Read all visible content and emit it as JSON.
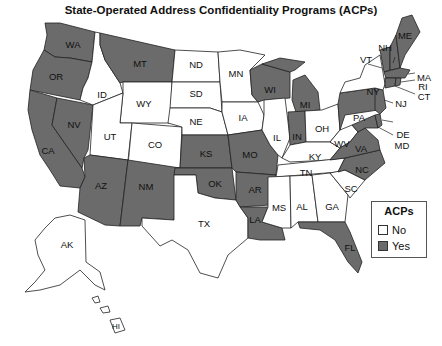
{
  "title": "State-Operated Address Confidentiality Programs (ACPs)",
  "colors": {
    "yes": "#6b6b6b",
    "no": "#ffffff",
    "border": "#222222"
  },
  "legend": {
    "title": "ACPs",
    "items": [
      {
        "label": "No",
        "color": "#ffffff"
      },
      {
        "label": "Yes",
        "color": "#6b6b6b"
      }
    ]
  },
  "states": {
    "WA": "Yes",
    "OR": "Yes",
    "CA": "Yes",
    "NV": "Yes",
    "ID": "No",
    "MT": "Yes",
    "WY": "No",
    "UT": "No",
    "CO": "No",
    "AZ": "Yes",
    "NM": "Yes",
    "ND": "No",
    "SD": "No",
    "NE": "No",
    "KS": "Yes",
    "OK": "Yes",
    "TX": "No",
    "MN": "No",
    "IA": "No",
    "MO": "Yes",
    "AR": "Yes",
    "LA": "Yes",
    "WI": "Yes",
    "IL": "No",
    "MI": "Yes",
    "IN": "Yes",
    "OH": "No",
    "KY": "No",
    "TN": "No",
    "MS": "No",
    "AL": "No",
    "GA": "No",
    "FL": "Yes",
    "SC": "No",
    "NC": "Yes",
    "VA": "Yes",
    "WV": "No",
    "PA": "Yes",
    "NY": "No",
    "NJ": "Yes",
    "DE": "Yes",
    "MD": "Yes",
    "CT": "Yes",
    "RI": "Yes",
    "MA": "Yes",
    "VT": "Yes",
    "NH": "Yes",
    "ME": "Yes",
    "AK": "No",
    "HI": "No"
  },
  "labels": {
    "WA": "WA",
    "OR": "OR",
    "CA": "CA",
    "NV": "NV",
    "ID": "ID",
    "MT": "MT",
    "WY": "WY",
    "UT": "UT",
    "CO": "CO",
    "AZ": "AZ",
    "NM": "NM",
    "ND": "ND",
    "SD": "SD",
    "NE": "NE",
    "KS": "KS",
    "OK": "OK",
    "TX": "TX",
    "MN": "MN",
    "IA": "IA",
    "MO": "MO",
    "AR": "AR",
    "LA": "LA",
    "WI": "WI",
    "IL": "IL",
    "MI": "MI",
    "IN": "IN",
    "OH": "OH",
    "KY": "KY",
    "TN": "TN",
    "MS": "MS",
    "AL": "AL",
    "GA": "GA",
    "FL": "FL",
    "SC": "SC",
    "NC": "NC",
    "VA": "VA",
    "WV": "WV",
    "PA": "PA",
    "NY": "NY",
    "NJ": "NJ",
    "DE": "DE",
    "MD": "MD",
    "CT": "CT",
    "RI": "RI",
    "MA": "MA",
    "VT": "VT",
    "NH": "NH",
    "ME": "ME",
    "AK": "AK",
    "HI": "HI"
  }
}
